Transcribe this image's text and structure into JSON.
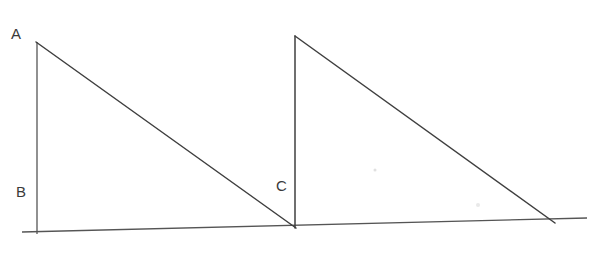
{
  "diagram": {
    "colors": {
      "line": "#3f3f3f",
      "label": "#3a3a3a",
      "background": "#ffffff"
    },
    "labels": {
      "A": "A",
      "B": "B",
      "C": "C"
    },
    "points": {
      "A": [
        36,
        42
      ],
      "B": [
        37,
        232
      ],
      "C": [
        295,
        227
      ],
      "D_top": [
        295,
        36
      ],
      "E_right": [
        553,
        221
      ]
    },
    "baseline": {
      "from": [
        22,
        232
      ],
      "to": [
        587,
        218
      ]
    },
    "triangles": [
      {
        "name": "triangle-ABC",
        "vertices": [
          "A",
          "B",
          "C"
        ]
      },
      {
        "name": "triangle-C-top-right",
        "vertices": [
          "C",
          "D_top",
          "E_right"
        ]
      }
    ]
  }
}
